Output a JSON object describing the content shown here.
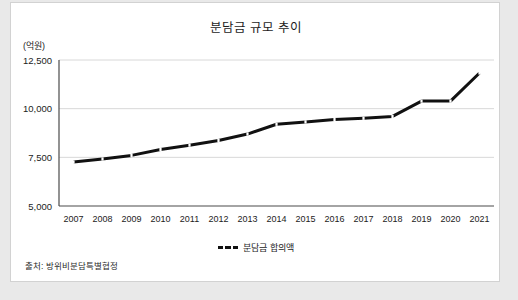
{
  "chart_data": {
    "type": "line",
    "title": "분담금 규모 추이",
    "unit_label": "(억원)",
    "xlabel": "",
    "ylabel": "",
    "categories": [
      "2007",
      "2008",
      "2009",
      "2010",
      "2011",
      "2012",
      "2013",
      "2014",
      "2015",
      "2016",
      "2017",
      "2018",
      "2019",
      "2020",
      "2021"
    ],
    "series": [
      {
        "name": "분담금 합의액",
        "values": [
          7255,
          7415,
          7600,
          7904,
          8125,
          8361,
          8695,
          9200,
          9320,
          9441,
          9507,
          9602,
          10389,
          10389,
          11833
        ]
      }
    ],
    "ylim": [
      5000,
      12500
    ],
    "yticks": [
      5000,
      7500,
      10000,
      12500
    ],
    "ytick_labels": [
      "5,000",
      "7,500",
      "10,000",
      "12,500"
    ],
    "grid": true,
    "legend_position": "bottom",
    "line_color": "#111111",
    "grid_color": "#d8d8d8",
    "axis_color": "#4a4a4a"
  },
  "legend": {
    "label": "분담금 합의액"
  },
  "source": {
    "text": "출처: 방위비분담특별협정"
  }
}
